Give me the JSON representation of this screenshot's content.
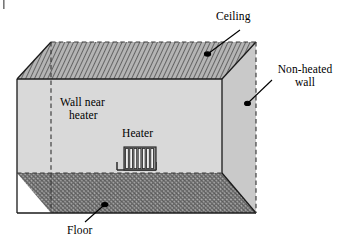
{
  "figure": {
    "kind": "room-enclosure-3d-diagram",
    "background_color": "#ffffff"
  },
  "labels": {
    "ceiling": "Ceiling",
    "non_heated_wall_line1": "Non-heated",
    "non_heated_wall_line2": "wall",
    "wall_near_heater_line1": "Wall near",
    "wall_near_heater_line2": "heater",
    "heater": "Heater",
    "floor": "Floor"
  },
  "colors": {
    "outline": "#1a1a1a",
    "back_wall_fill": "#d9d9d9",
    "side_wall_fill": "#c9c9c9",
    "ceiling_fill": "#b2b2b2",
    "floor_fill": "#a8a8a8",
    "hatch_stroke": "#4d4d4d",
    "heater_fin_fill": "#f2f2f2",
    "leader_line": "#000000",
    "text": "#000000"
  },
  "geometry": {
    "back_wall": "17,79 222,79 222,173 17,173",
    "ceiling": "17,79 51,42 256,42 222,79",
    "side_wall": "222,79 256,42 256,213 222,173",
    "floor": "17,173 222,173 256,213 51,213",
    "ceiling_top_edge_dashed": "51,42 256,42",
    "side_outer_edge_dashed": "256,42 256,213",
    "back_left_corner_dashed": "51,42 51,213",
    "floor_inner_edge_dashed": "17,173 222,173"
  },
  "heater": {
    "fin_count": 7,
    "body_x": 124,
    "body_y": 147,
    "body_width": 32,
    "body_height": 23,
    "foot_left_x": 117,
    "foot_right_x": 156,
    "foot_y": 170
  },
  "leaders": [
    {
      "name": "ceiling-leader",
      "path": "M 240,30 L 208,54",
      "dot": "207.5,54"
    },
    {
      "name": "non-heated-wall-leader",
      "path": "M 272,80 L 248,103",
      "dot": "247.5,103.5"
    },
    {
      "name": "floor-leader",
      "path": "M 85,222 L 104,205",
      "dot": "105,204.5"
    }
  ],
  "crop_mark": {
    "name": "crop-tick",
    "x": 3,
    "y": 0,
    "width": 2,
    "height": 9
  }
}
